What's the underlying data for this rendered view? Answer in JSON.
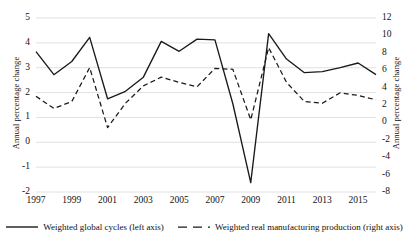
{
  "chart_data": {
    "type": "line",
    "title": "",
    "xlabel": "",
    "ylabel": "Annual percentage change",
    "y2label": "Annual percentage change",
    "grid": true,
    "legend_position": "bottom",
    "x": [
      1997,
      1998,
      1999,
      2000,
      2001,
      2002,
      2003,
      2004,
      2005,
      2006,
      2007,
      2008,
      2009,
      2010,
      2011,
      2012,
      2013,
      2014,
      2015,
      2016
    ],
    "xtick_labels": [
      "1997",
      "1999",
      "2001",
      "2003",
      "2005",
      "2007",
      "2009",
      "2011",
      "2013",
      "2015"
    ],
    "xtick_values": [
      1997,
      1999,
      2001,
      2003,
      2005,
      2007,
      2009,
      2011,
      2013,
      2015
    ],
    "ylim": [
      -2,
      5
    ],
    "ytick_labels": [
      "5",
      "4",
      "3",
      "2",
      "1",
      "0",
      "-1",
      "-2"
    ],
    "ytick_values": [
      5,
      4,
      3,
      2,
      1,
      0,
      -1,
      -2
    ],
    "y2lim": [
      -8,
      12
    ],
    "y2tick_labels": [
      "12",
      "10",
      "8",
      "6",
      "4",
      "2",
      "0",
      "-2",
      "-4",
      "-6",
      "-8"
    ],
    "y2tick_values": [
      12,
      10,
      8,
      6,
      4,
      2,
      0,
      -2,
      -4,
      -6,
      -8
    ],
    "series": [
      {
        "name": "Weighted global cycles (left axis)",
        "axis": "left",
        "style": "solid",
        "color": "#1a1a1a",
        "values": [
          3.65,
          2.72,
          3.25,
          4.22,
          1.75,
          2.05,
          2.62,
          4.06,
          3.66,
          4.15,
          4.12,
          1.55,
          -1.62,
          4.37,
          3.35,
          2.8,
          2.84,
          3.0,
          3.19,
          2.72
        ]
      },
      {
        "name": "Weighted real manufacturing production (right axis)",
        "axis": "right",
        "style": "dashed",
        "color": "#1a1a1a",
        "values": [
          3.0,
          1.6,
          2.4,
          6.3,
          -0.6,
          2.2,
          4.2,
          5.2,
          4.6,
          4.1,
          6.2,
          6.1,
          0.3,
          8.6,
          4.6,
          2.4,
          2.2,
          3.4,
          3.1,
          2.6
        ]
      }
    ]
  },
  "legend": {
    "entries": [
      {
        "label": "Weighted global cycles (left axis)",
        "style": "solid"
      },
      {
        "label": "Weighted real manufacturing production (right axis)",
        "style": "dashed"
      }
    ]
  }
}
